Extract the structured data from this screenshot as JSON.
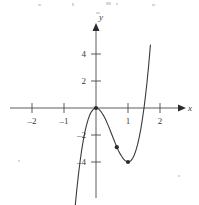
{
  "figure": {
    "background": "#ffffff",
    "ink_color": "#3a3a3a"
  },
  "chart_data": {
    "type": "line",
    "title": "",
    "subtitle": "",
    "xlabel": "x",
    "ylabel": "y",
    "xlim": [
      -2.35,
      2.35
    ],
    "ylim": [
      -5.2,
      5.6
    ],
    "grid": false,
    "legend": false,
    "legend_position": "none",
    "x_ticks": [
      -2,
      -1,
      1,
      2
    ],
    "x_tick_labels": [
      "–2",
      "–1",
      "1",
      "2"
    ],
    "y_ticks": [
      -4,
      -2,
      2,
      4
    ],
    "y_tick_labels": [
      "–4",
      "–2",
      "2",
      "4"
    ],
    "axis_arrows": [
      "x-positive",
      "y-positive"
    ],
    "series": [
      {
        "name": "cubic",
        "equation": "y = 4x^3 - 6x^2",
        "color": "#3a3a3a",
        "x": [
          -1.05,
          -1.0,
          -0.95,
          -0.9,
          -0.85,
          -0.8,
          -0.75,
          -0.7,
          -0.65,
          -0.6,
          -0.55,
          -0.5,
          -0.45,
          -0.4,
          -0.35,
          -0.3,
          -0.25,
          -0.2,
          -0.15,
          -0.1,
          -0.05,
          0.0,
          0.05,
          0.1,
          0.15,
          0.2,
          0.25,
          0.3,
          0.35,
          0.4,
          0.45,
          0.5,
          0.55,
          0.6,
          0.65,
          0.7,
          0.75,
          0.8,
          0.85,
          0.9,
          0.95,
          1.0,
          1.05,
          1.1,
          1.15,
          1.2,
          1.25,
          1.3,
          1.35,
          1.4,
          1.45,
          1.5,
          1.55,
          1.6,
          1.65,
          1.7
        ],
        "y": [
          -11.25,
          -10.0,
          -8.84,
          -7.77,
          -6.79,
          -5.89,
          -5.06,
          -4.31,
          -3.63,
          -3.02,
          -2.48,
          -2.0,
          -1.58,
          -1.22,
          -0.9,
          -0.65,
          -0.44,
          -0.27,
          -0.15,
          -0.07,
          -0.02,
          0.0,
          -0.01,
          -0.06,
          -0.12,
          -0.21,
          -0.31,
          -0.43,
          -0.56,
          -0.7,
          -0.85,
          -1.0,
          -1.15,
          -1.3,
          -1.44,
          -1.57,
          -1.69,
          -1.79,
          -1.88,
          -1.94,
          -1.98,
          -2.0,
          -1.99,
          -1.94,
          -1.85,
          -1.73,
          -1.56,
          -1.35,
          -1.09,
          -0.78,
          -0.41,
          0.0,
          0.48,
          1.02,
          1.64,
          2.33
        ]
      }
    ],
    "marked_points": [
      {
        "name": "origin-point",
        "x": 0.0,
        "y": 0.0
      },
      {
        "name": "inflection-point",
        "x": 0.65,
        "y": -1.45
      },
      {
        "name": "minimum-point",
        "x": 1.0,
        "y": -2.0
      }
    ]
  }
}
